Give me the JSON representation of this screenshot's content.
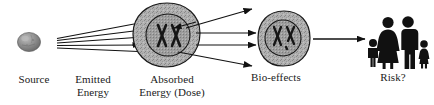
{
  "figure": {
    "background_color": "#ffffff",
    "ink_color": "#1a1a1a"
  },
  "labels": {
    "source": "Source",
    "emitted_line1": "Emitted",
    "emitted_line2": "Energy",
    "absorbed_line1": "Absorbed",
    "absorbed_line2": "Energy (Dose)",
    "bio_effects": "Bio-effects",
    "risk": "Risk?"
  },
  "nodes": [
    {
      "id": "source",
      "name": "radiation-source-sphere",
      "label": "Source",
      "shape": "textured-sphere",
      "cx": 29,
      "cy": 42,
      "rx": 11,
      "ry": 9,
      "fill": "#8e8e8e"
    },
    {
      "id": "absorbed-cell",
      "name": "absorbed-energy-cell",
      "label": "Absorbed Energy (Dose)",
      "shape": "cell-blob-with-nucleus",
      "cx": 167,
      "cy": 36,
      "outer_r": 33,
      "nucleus_r": 21,
      "contents": "XX",
      "fill": "#a8a8a8"
    },
    {
      "id": "bio-cell",
      "name": "bio-effects-cell",
      "label": "Bio-effects",
      "shape": "cell-blob-with-nucleus",
      "cx": 284,
      "cy": 38,
      "outer_r": 26,
      "nucleus_r": 17,
      "contents": "XX",
      "fill": "#a8a8a8"
    },
    {
      "id": "family",
      "name": "family-group-pictogram",
      "label": "Risk?",
      "shape": "four-person-pictogram",
      "members": [
        "boy",
        "woman",
        "man",
        "girl"
      ],
      "fill": "#111111"
    }
  ],
  "connections": [
    {
      "name": "emitted-beam-1",
      "from": "source",
      "to": "absorbed-cell",
      "style": "ray"
    },
    {
      "name": "emitted-beam-2",
      "from": "source",
      "to": "absorbed-cell",
      "style": "ray-arrow"
    },
    {
      "name": "emitted-beam-3",
      "from": "source",
      "to": "absorbed-cell",
      "style": "ray-arrow"
    },
    {
      "name": "emitted-beam-4",
      "from": "source",
      "to": "absorbed-cell",
      "style": "ray-arrow"
    },
    {
      "name": "scatter-arrow-up",
      "from": "absorbed-cell",
      "to": "free-space",
      "style": "arrow"
    },
    {
      "name": "scatter-arrow-mid-1",
      "from": "absorbed-cell",
      "to": "bio-cell",
      "style": "arrow"
    },
    {
      "name": "scatter-arrow-mid-2",
      "from": "absorbed-cell",
      "to": "bio-cell",
      "style": "arrow"
    },
    {
      "name": "scatter-arrow-down",
      "from": "absorbed-cell",
      "to": "free-space",
      "style": "arrow"
    },
    {
      "name": "bio-to-risk-arrow",
      "from": "bio-cell",
      "to": "family",
      "style": "arrow"
    }
  ]
}
